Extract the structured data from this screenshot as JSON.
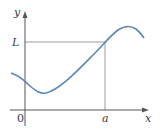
{
  "diagram": {
    "axes": {
      "x_label": "x",
      "y_label": "y",
      "origin_label": "0"
    },
    "markers": {
      "x_marker_label": "a",
      "y_marker_label": "L"
    },
    "colors": {
      "curve": "#5b86b8",
      "axes": "#555555",
      "guides": "#9a9a9a"
    }
  }
}
